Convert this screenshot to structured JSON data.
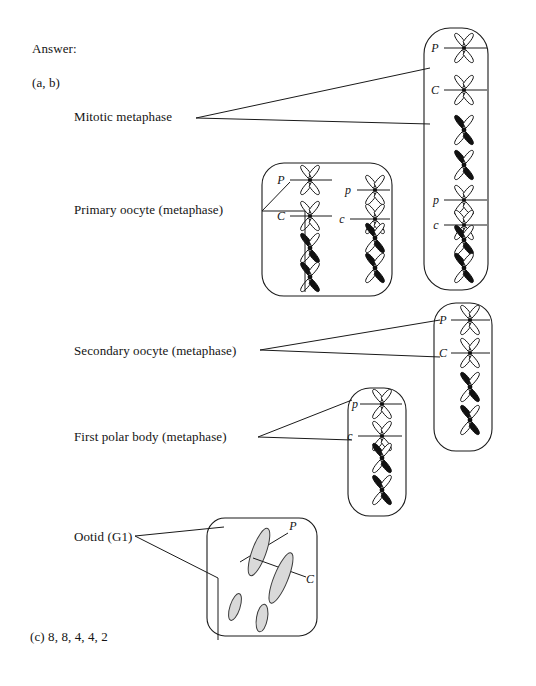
{
  "figure": {
    "answer_heading": "Answer:",
    "part_ab": "(a, b)",
    "part_c": "(c)  8, 8, 4, 4, 2"
  },
  "labels": {
    "mitotic": "Mitotic metaphase",
    "primary_oocyte": "Primary oocyte (metaphase)",
    "secondary_oocyte": "Secondary oocyte (metaphase)",
    "first_polar_body": "First polar body (metaphase)",
    "ootid": "Ootid (G1)"
  },
  "cells": [
    {
      "id": "mitotic-metaphase-cell",
      "name": "Mitotic metaphase",
      "chromosome_count": 8,
      "columns": 1,
      "chromosomes": [
        {
          "marker": "P",
          "marker_case": "upper",
          "fill": "open",
          "plate": true
        },
        {
          "marker": "C",
          "marker_case": "upper",
          "fill": "open",
          "plate": true
        },
        {
          "marker": "",
          "marker_case": "",
          "fill": "solid",
          "plate": false
        },
        {
          "marker": "",
          "marker_case": "",
          "fill": "solid",
          "plate": false
        },
        {
          "marker": "p",
          "marker_case": "lower",
          "fill": "open",
          "plate": true
        },
        {
          "marker": "c",
          "marker_case": "lower",
          "fill": "open",
          "plate": true
        },
        {
          "marker": "",
          "marker_case": "",
          "fill": "solid",
          "plate": false
        },
        {
          "marker": "",
          "marker_case": "",
          "fill": "solid",
          "plate": false
        }
      ]
    },
    {
      "id": "primary-oocyte-cell",
      "name": "Primary oocyte (metaphase)",
      "chromosome_count": 8,
      "columns": 2,
      "chromosomes": [
        {
          "marker": "P",
          "marker_case": "upper",
          "fill": "open",
          "plate": true
        },
        {
          "marker": "C",
          "marker_case": "upper",
          "fill": "open",
          "plate": true
        },
        {
          "marker": "",
          "marker_case": "",
          "fill": "solid",
          "plate": false
        },
        {
          "marker": "",
          "marker_case": "",
          "fill": "solid",
          "plate": false
        },
        {
          "marker": "p",
          "marker_case": "lower",
          "fill": "open",
          "plate": true
        },
        {
          "marker": "c",
          "marker_case": "lower",
          "fill": "open",
          "plate": true
        },
        {
          "marker": "",
          "marker_case": "",
          "fill": "solid",
          "plate": false
        },
        {
          "marker": "",
          "marker_case": "",
          "fill": "solid",
          "plate": false
        }
      ]
    },
    {
      "id": "secondary-oocyte-cell",
      "name": "Secondary oocyte (metaphase)",
      "chromosome_count": 4,
      "columns": 1,
      "chromosomes": [
        {
          "marker": "P",
          "marker_case": "upper",
          "fill": "open",
          "plate": true
        },
        {
          "marker": "C",
          "marker_case": "upper",
          "fill": "open",
          "plate": true
        },
        {
          "marker": "",
          "marker_case": "",
          "fill": "solid",
          "plate": false
        },
        {
          "marker": "",
          "marker_case": "",
          "fill": "solid",
          "plate": false
        }
      ]
    },
    {
      "id": "first-polar-body-cell",
      "name": "First polar body (metaphase)",
      "chromosome_count": 4,
      "columns": 1,
      "chromosomes": [
        {
          "marker": "p",
          "marker_case": "lower",
          "fill": "open",
          "plate": true
        },
        {
          "marker": "c",
          "marker_case": "lower",
          "fill": "open",
          "plate": true
        },
        {
          "marker": "",
          "marker_case": "",
          "fill": "solid",
          "plate": false
        },
        {
          "marker": "",
          "marker_case": "",
          "fill": "solid",
          "plate": false
        }
      ]
    },
    {
      "id": "ootid-cell",
      "name": "Ootid (G1)",
      "chromosome_count": 4,
      "columns": 0,
      "chromosomes": [
        {
          "marker": "P",
          "marker_case": "upper",
          "fill": "gray",
          "plate": false
        },
        {
          "marker": "C",
          "marker_case": "upper",
          "fill": "gray",
          "plate": false
        },
        {
          "marker": "",
          "marker_case": "",
          "fill": "gray",
          "plate": false
        },
        {
          "marker": "",
          "marker_case": "",
          "fill": "gray",
          "plate": false
        }
      ]
    }
  ],
  "markers": {
    "mitotic": [
      "P",
      "C",
      "p",
      "c"
    ],
    "primary": [
      "P",
      "C",
      "p",
      "c"
    ],
    "secondary": [
      "P",
      "C"
    ],
    "polarbody": [
      "p",
      "c"
    ],
    "ootid": [
      "P",
      "C"
    ]
  },
  "colors": {
    "ink": "#1a1a1a",
    "paper": "#ffffff",
    "chromatin_fill": "#111111",
    "g1_fill": "#d9d9d9",
    "g1_stroke": "#3a3a3a"
  }
}
